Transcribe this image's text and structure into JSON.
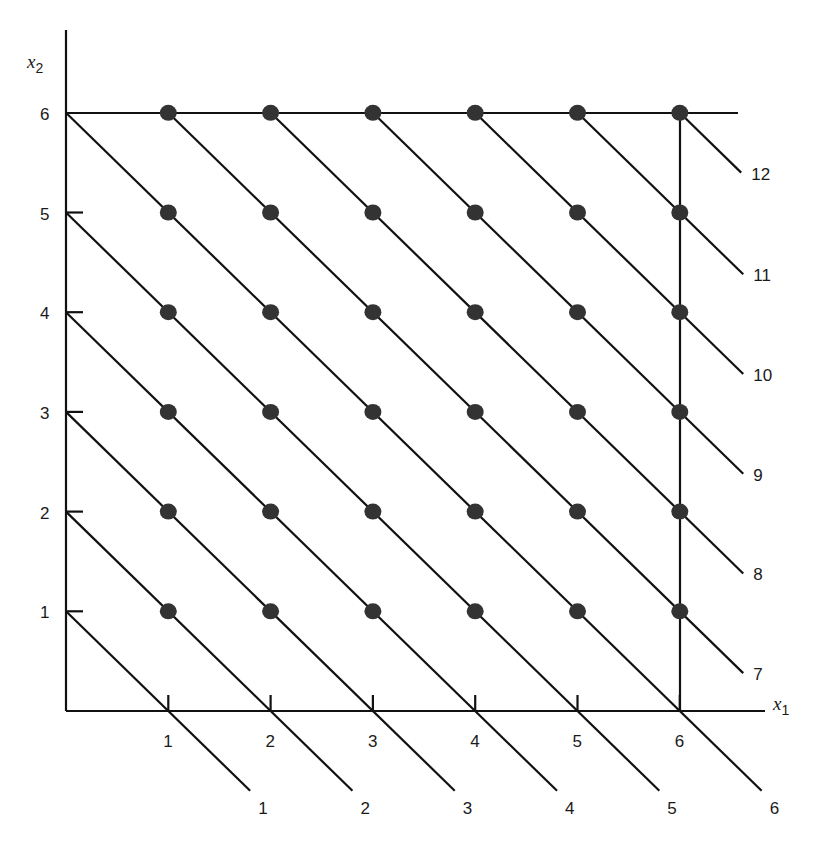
{
  "chart_data": {
    "type": "scatter",
    "title": "",
    "xlabel": "x1",
    "ylabel": "x2",
    "x_ticks": [
      1,
      2,
      3,
      4,
      5,
      6
    ],
    "y_ticks": [
      1,
      2,
      3,
      4,
      5,
      6
    ],
    "xlim": [
      0,
      6.8
    ],
    "ylim": [
      0,
      6.8
    ],
    "grid": false,
    "points": [
      [
        1,
        1
      ],
      [
        2,
        1
      ],
      [
        3,
        1
      ],
      [
        4,
        1
      ],
      [
        5,
        1
      ],
      [
        6,
        1
      ],
      [
        1,
        2
      ],
      [
        2,
        2
      ],
      [
        3,
        2
      ],
      [
        4,
        2
      ],
      [
        5,
        2
      ],
      [
        6,
        2
      ],
      [
        1,
        3
      ],
      [
        2,
        3
      ],
      [
        3,
        3
      ],
      [
        4,
        3
      ],
      [
        5,
        3
      ],
      [
        6,
        3
      ],
      [
        1,
        4
      ],
      [
        2,
        4
      ],
      [
        3,
        4
      ],
      [
        4,
        4
      ],
      [
        5,
        4
      ],
      [
        6,
        4
      ],
      [
        1,
        5
      ],
      [
        2,
        5
      ],
      [
        3,
        5
      ],
      [
        4,
        5
      ],
      [
        5,
        5
      ],
      [
        6,
        5
      ],
      [
        1,
        6
      ],
      [
        2,
        6
      ],
      [
        3,
        6
      ],
      [
        4,
        6
      ],
      [
        5,
        6
      ],
      [
        6,
        6
      ]
    ],
    "lines": {
      "description": "level lines x1 + x2 = k",
      "k_values": [
        1,
        2,
        3,
        4,
        5,
        6,
        7,
        8,
        9,
        10,
        11,
        12
      ],
      "labels_bottom": [
        "1",
        "2",
        "3",
        "4",
        "5",
        "6"
      ],
      "labels_right": [
        "7",
        "8",
        "9",
        "10",
        "11",
        "12"
      ]
    },
    "boundary": {
      "top_line_x2": 6,
      "right_line_x1": 6
    }
  },
  "axes": {
    "x_label_main": "x",
    "x_label_sub": "1",
    "y_label_main": "x",
    "y_label_sub": "2",
    "x_tick_labels": [
      "1",
      "2",
      "3",
      "4",
      "5",
      "6"
    ],
    "y_tick_labels": [
      "1",
      "2",
      "3",
      "4",
      "5",
      "6"
    ]
  },
  "style": {
    "line_color": "#111111",
    "dot_color": "#333333",
    "text_color": "#1a1a1a"
  }
}
